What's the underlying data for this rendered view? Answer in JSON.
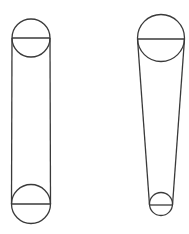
{
  "diagram": {
    "stroke_color": "#3a3a3a",
    "background": "#ffffff",
    "drives": [
      {
        "name": "equal-pulley-drive",
        "top_pulley": {
          "cx": 31,
          "cy": 38,
          "r": 19
        },
        "bottom_pulley": {
          "cx": 31,
          "cy": 204,
          "r": 19.5
        }
      },
      {
        "name": "unequal-pulley-drive",
        "top_pulley": {
          "cx": 161,
          "cy": 38,
          "r": 23.5
        },
        "bottom_pulley": {
          "cx": 161,
          "cy": 204,
          "r": 11.5
        }
      }
    ]
  }
}
